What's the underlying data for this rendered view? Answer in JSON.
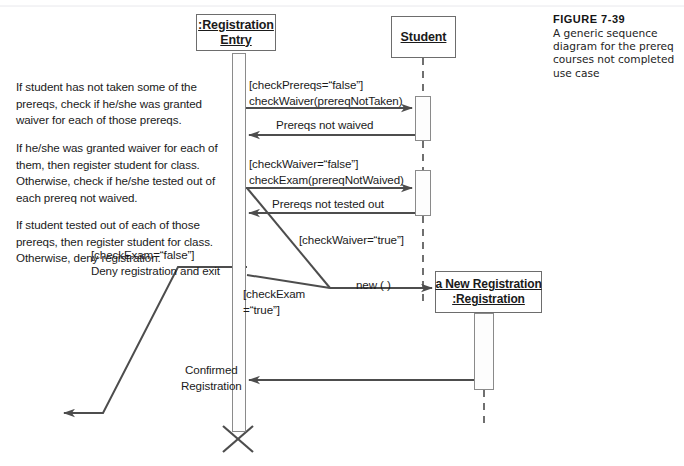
{
  "figure": {
    "number": "FIGURE 7-39",
    "caption": "A generic sequence diagram for the prereq courses not completed use case"
  },
  "lifelines": [
    {
      "id": "registration-entry",
      "line1": ":Registration",
      "line2": "Entry"
    },
    {
      "id": "student",
      "line1": "Student",
      "line2": ""
    },
    {
      "id": "new-registration",
      "line1": "a New Registration",
      "line2": ":Registration"
    }
  ],
  "notes": [
    {
      "id": "note-1",
      "text": "If student has not taken some of the prereqs, check if he/she was granted waiver for each of those prereqs."
    },
    {
      "id": "note-2",
      "text": "If he/she was granted waiver for each of them, then register student for class. Otherwise, check if he/she tested out of each prereq not waived."
    },
    {
      "id": "note-3",
      "text": "If student tested out of each of those prereqs, then register student for class. Otherwise, deny registration."
    }
  ],
  "messages": {
    "check_waiver": "[checkPrereqs=“false”]\ncheckWaiver(prereqNotTaken)",
    "prereqs_not_waived": "Prereqs not waived",
    "check_exam": "[checkWaiver=“false”]\ncheckExam(prereqNotWaived)",
    "prereqs_not_tested_out": "Prereqs not tested out",
    "check_waiver_true": "[checkWaiver=“true”]",
    "deny": "[checkExam=“false”]\nDeny registration and exit",
    "new_call": "new ( )",
    "check_exam_true": "[checkExam\n=“true”]",
    "confirmed": "Confirmed\nRegistration"
  },
  "colors": {
    "line": "#4d4d4d",
    "box_border": "#6d6d6d",
    "activation_border": "#8a8a8a",
    "text": "#1a1a1a",
    "background": "#ffffff"
  }
}
